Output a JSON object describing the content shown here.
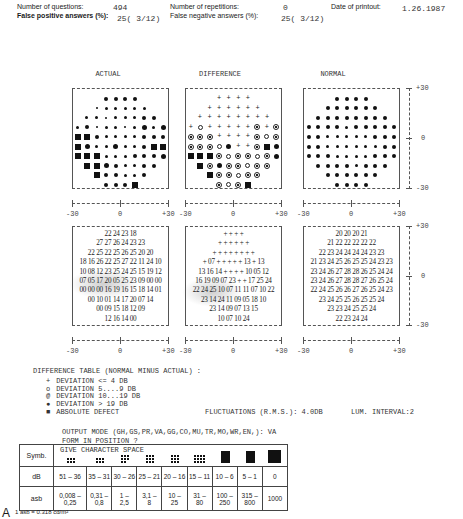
{
  "header": {
    "questions_label": "Number of questions:",
    "questions_value": "494",
    "repetitions_label": "Number of repetitions:",
    "repetitions_value": "0",
    "date_label": "Date of printout:",
    "date_value": "1.26.1987",
    "false_pos_label": "False positive answers (%):",
    "false_pos_value": "25( 3/12)",
    "false_neg_label": "False negative answers (%):",
    "false_neg_value": "25( 3/12)"
  },
  "panels": {
    "actual_title": "ACTUAL",
    "difference_title": "DIFFERENCE",
    "normal_title": "NORMAL"
  },
  "axis": {
    "neg": "-30",
    "zero": "0",
    "pos": "+30"
  },
  "actual_values": [
    "22 24 23 18",
    "27 27 26 24 23 23",
    "22 25 22 25 26 25 20 20",
    "18 16 26 22 25 27 22 11 24 10",
    "10 08 12 23 25 24 25 15 19 12",
    "07 05 17 20 05 25 23 09 00 00",
    "00 00 00 16 19 16 15 18 14 01",
    "00 10 01 14 17 20 07 14",
    "00 09 15 18 12 09",
    "12 16 14 00"
  ],
  "difference_values": [
    "+ + + +",
    "+ + + + + +",
    "+ + + + + + + +",
    "+ 07 + + + + + 13 + 13",
    "13 16 14 + + + + 10 05 12",
    "16 19 09 07 23 + + 17 25 24",
    "22 24 25 10 07 11 11 07 10 22",
    "23 14 24 11 09 05 18 10",
    "23 14 09 07 13 15",
    "10 07 10 24"
  ],
  "normal_values": [
    "20 20 20 21",
    "21 22 22 22 22 22",
    "22 23 24 24 24 24 23 23",
    "21 23 24 25 26 25 25 24 23 23",
    "23 24 26 27 28 28 26 25 24 24",
    "23 24 26 27 28 28 27 26 25 24",
    "22 24 25 26 26 27 26 25 24 23",
    "23 24 25 25 26 25 25 24",
    "23 23 24 25 25 24",
    "22 23 24 24"
  ],
  "actual_symbols": [
    [
      "d3",
      "d3",
      "d3",
      "d3"
    ],
    [
      "d1",
      "d2",
      "d2",
      "d2",
      "d2",
      "d2"
    ],
    [
      "d2",
      "d2",
      "d1",
      "d2",
      "d2",
      "d2",
      "d3",
      "d3"
    ],
    [
      "d2",
      "d3",
      "d1",
      "d2",
      "d2",
      "d1",
      "d2",
      "d4",
      "d2",
      "d4"
    ],
    [
      "sq",
      "sq",
      "d3",
      "d2",
      "d2",
      "d2",
      "d2",
      "d3",
      "d3",
      "d3"
    ],
    [
      "sq",
      "d4",
      "d2",
      "d2",
      "d4",
      "d2",
      "d2",
      "d3",
      "sq",
      "sq"
    ],
    [
      "sq",
      "sq",
      "sq",
      "d2",
      "d2",
      "d2",
      "d3",
      "d3",
      "d3",
      "d4"
    ],
    [
      "sq",
      "sq",
      "d4",
      "d3",
      "d2",
      "d2",
      "d3",
      "d3"
    ],
    [
      "sq",
      "d3",
      "d3",
      "d2",
      "d2",
      "d3"
    ],
    [
      "d3",
      "d3",
      "d3",
      "sq"
    ]
  ],
  "difference_symbols": [
    [
      "plus",
      "plus",
      "plus",
      "plus"
    ],
    [
      "plus",
      "plus",
      "plus",
      "plus",
      "plus",
      "plus"
    ],
    [
      "plus",
      "plus",
      "plus",
      "plus",
      "plus",
      "plus",
      "plus",
      "plus"
    ],
    [
      "plus",
      "ring",
      "plus",
      "plus",
      "plus",
      "plus",
      "plus",
      "ring2",
      "plus",
      "ring2"
    ],
    [
      "ring2",
      "ring2",
      "ring2",
      "plus",
      "plus",
      "plus",
      "plus",
      "ring2",
      "ring",
      "ring2"
    ],
    [
      "ring2",
      "ring2",
      "ring2",
      "ring",
      "dot",
      "plus",
      "plus",
      "ring2",
      "sq",
      "dot"
    ],
    [
      "sq",
      "sq",
      "sq",
      "ring2",
      "ring",
      "ring2",
      "ring2",
      "ring",
      "ring2",
      "dot"
    ],
    [
      "sq",
      "ring2",
      "dot",
      "ring2",
      "ring2",
      "ring",
      "ring2",
      "ring2"
    ],
    [
      "sq",
      "ring2",
      "ring2",
      "ring",
      "ring2",
      "ring2"
    ],
    [
      "ring2",
      "ring",
      "ring2",
      "sq"
    ]
  ],
  "normal_symbols": [
    [
      "d3",
      "d3",
      "d3",
      "d3"
    ],
    [
      "d3",
      "d3",
      "d3",
      "d3",
      "d3",
      "d3"
    ],
    [
      "d3",
      "d3",
      "d3",
      "d3",
      "d3",
      "d3",
      "d3",
      "d3"
    ],
    [
      "d3",
      "d3",
      "d3",
      "d3",
      "d2",
      "d3",
      "d3",
      "d3",
      "d3",
      "d3"
    ],
    [
      "d3",
      "d3",
      "d2",
      "d2",
      "d2",
      "d2",
      "d2",
      "d3",
      "d3",
      "d3"
    ],
    [
      "d3",
      "d3",
      "d2",
      "d2",
      "d2",
      "d2",
      "d2",
      "d2",
      "d3",
      "d3"
    ],
    [
      "d3",
      "d3",
      "d3",
      "d2",
      "d2",
      "d2",
      "d2",
      "d3",
      "d3",
      "d3"
    ],
    [
      "d3",
      "d3",
      "d3",
      "d3",
      "d2",
      "d3",
      "d3",
      "d3"
    ],
    [
      "d3",
      "d3",
      "d3",
      "d3",
      "d3",
      "d3"
    ],
    [
      "d3",
      "d3",
      "d3",
      "d3"
    ]
  ],
  "legend": {
    "title": "DIFFERENCE TABLE (NORMAL MINUS ACTUAL) :",
    "items": [
      {
        "symbol": "+",
        "label": "DEVIATION <= 4 DB"
      },
      {
        "symbol": "o",
        "label": "DEVIATION  5....9 DB"
      },
      {
        "symbol": "@",
        "label": "DEVIATION 10...19 DB"
      },
      {
        "symbol": "●",
        "label": "DEVIATION > 19 DB"
      },
      {
        "symbol": "■",
        "label": "ABSOLUTE DEFECT"
      }
    ],
    "fluctuations": "FLUCTUATIONS (R.M.S.): 4.0DB",
    "lum_interval": "LUM. INTERVAL:2"
  },
  "console": {
    "output_mode": "OUTPUT MODE (GH,GS,PR,VA,GG,CO,MU,TR,MO,WR,EN,):   VA",
    "form_position": "FORM IN POSITION ?",
    "give_char": "GIVE CHARACTER SPACE"
  },
  "sensitivity_table": {
    "row_labels": [
      "Symb.",
      "dB",
      "asb"
    ],
    "db": [
      "51 – 36",
      "35 – 31",
      "30 – 26",
      "25 – 21",
      "20 – 16",
      "15 – 11",
      "10 – 6",
      "5 – 1",
      "0"
    ],
    "asb_top": [
      "0,008 –",
      "0,31 –",
      "1 –",
      "3,1 –",
      "10 –",
      "31 –",
      "100 –",
      "315 –",
      "1000"
    ],
    "asb_bottom": [
      "0,25",
      "0,8",
      "2,5",
      "8",
      "25",
      "80",
      "250",
      "800",
      ""
    ],
    "patterns": [
      [
        3,
        3,
        6
      ],
      [
        3,
        3,
        6
      ],
      [
        3,
        3,
        8
      ],
      [
        3,
        3,
        9
      ],
      [
        3,
        3,
        9
      ],
      [
        3,
        4,
        12
      ],
      [
        4,
        4,
        16
      ],
      [
        4,
        4,
        16
      ],
      [
        1,
        1,
        1
      ]
    ]
  },
  "footer": {
    "figure_label": "A",
    "unit_note": "1 asb = 0.318 cd/m²"
  }
}
